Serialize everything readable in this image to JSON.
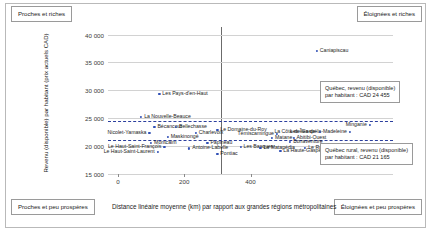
{
  "quadrants": {
    "top_left": "Proches et riches",
    "top_right": "Éloignées et riches",
    "bottom_left": "Proches et peu prospères",
    "bottom_right": "Éloignées et peu prospères"
  },
  "axes": {
    "ylabel": "Revenu (disponible) par habitant (prix actuels CAD)",
    "xlabel": "Distance linéaire moyenne (km) par rapport aux grandes régions métropolitaines",
    "yticks": [
      "15 000",
      "20 000",
      "25 000",
      "30 000",
      "35 000",
      "40 000"
    ],
    "xticks": [
      "0",
      "200",
      "400"
    ]
  },
  "callouts": {
    "quebec": "Québec, revenu (disponible)\npar habitant : CAD 24 455",
    "quebec_line1": "Québec, revenu (disponible)",
    "quebec_line2": "par habitant : CAD 24 455",
    "rural_line1": "Québec rural, revenu (disponible)",
    "rural_line2": "par habitant : CAD 21 165"
  },
  "chart_data": {
    "type": "scatter",
    "title": "",
    "xlabel": "Distance linéaire moyenne (km) par rapport aux grandes régions métropolitaines",
    "ylabel": "Revenu (disponible) par habitant (prix actuels CAD)",
    "xlim": [
      -30,
      830
    ],
    "ylim": [
      15000,
      41000
    ],
    "xticks": [
      0,
      200,
      400
    ],
    "yticks": [
      15000,
      20000,
      25000,
      30000,
      35000,
      40000
    ],
    "grid": "horizontal",
    "legend": "none",
    "reference_lines": [
      {
        "orientation": "vertical",
        "value": 310,
        "label": "distance moyenne",
        "color": "#6b6b6b"
      },
      {
        "orientation": "horizontal",
        "value": 24455,
        "label": "Québec, revenu (disponible) par habitant : CAD 24 455",
        "color": "#2c3f9e",
        "style": "dashed"
      },
      {
        "orientation": "horizontal",
        "value": 21165,
        "label": "Québec rural, revenu (disponible) par habitant : CAD 21 165",
        "color": "#2c3f9e",
        "style": "dashed"
      }
    ],
    "points": [
      {
        "label": "Caniapiscau",
        "x": 600,
        "y": 37000,
        "side": "right"
      },
      {
        "label": "Les Pays-d'en-Haut",
        "x": 125,
        "y": 29400,
        "side": "right"
      },
      {
        "label": "La Nouvelle-Beauce",
        "x": 70,
        "y": 25200,
        "side": "right"
      },
      {
        "label": "Bécancour",
        "x": 110,
        "y": 23500,
        "side": "right"
      },
      {
        "label": "Bellechasse",
        "x": 175,
        "y": 23500,
        "side": "right"
      },
      {
        "label": "Nicolet-Yamaska",
        "x": 95,
        "y": 22300,
        "side": "left"
      },
      {
        "label": "Charlevoix",
        "x": 235,
        "y": 22300,
        "side": "right"
      },
      {
        "label": "Minganie",
        "x": 760,
        "y": 23800,
        "side": "left"
      },
      {
        "label": "Le Domaine-du-Roy",
        "x": 300,
        "y": 22900,
        "side": "right"
      },
      {
        "label": "Les Îles-de-la-Madeleine",
        "x": 700,
        "y": 22600,
        "side": "left"
      },
      {
        "label": "La Côte-de-Gaspé",
        "x": 610,
        "y": 22600,
        "side": "left"
      },
      {
        "label": "Témiscamingue",
        "x": 480,
        "y": 22200,
        "side": "left"
      },
      {
        "label": "Maskinongé",
        "x": 150,
        "y": 21700,
        "side": "right"
      },
      {
        "label": "Matane",
        "x": 465,
        "y": 21500,
        "side": "right"
      },
      {
        "label": "Abitibi-Ouest",
        "x": 530,
        "y": 21500,
        "side": "right"
      },
      {
        "label": "Montcalm",
        "x": 100,
        "y": 20600,
        "side": "right"
      },
      {
        "label": "Papineau",
        "x": 270,
        "y": 20600,
        "side": "right"
      },
      {
        "label": "Bonaventure",
        "x": 520,
        "y": 20800,
        "side": "right"
      },
      {
        "label": "Le Haut-Saint-François",
        "x": 140,
        "y": 19900,
        "side": "left"
      },
      {
        "label": "Antoine-Labelle",
        "x": 215,
        "y": 19600,
        "side": "right"
      },
      {
        "label": "Les Basques",
        "x": 370,
        "y": 19900,
        "side": "right"
      },
      {
        "label": "La Matapédia",
        "x": 430,
        "y": 19700,
        "side": "right"
      },
      {
        "label": "Le Rocher-Percé",
        "x": 565,
        "y": 19700,
        "side": "right"
      },
      {
        "label": "La Haute-Gaspésie",
        "x": 490,
        "y": 19200,
        "side": "right"
      },
      {
        "label": "Le Haut-Saint-Laurent",
        "x": 120,
        "y": 19000,
        "side": "left"
      },
      {
        "label": "Pontiac",
        "x": 300,
        "y": 18600,
        "side": "right"
      }
    ]
  }
}
